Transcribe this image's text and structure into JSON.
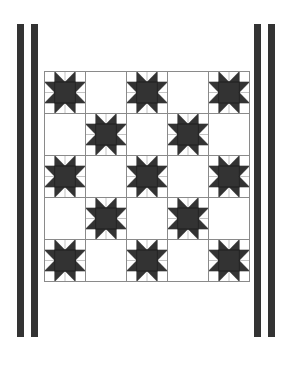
{
  "design": {
    "type": "quilt-pattern",
    "block_name": "sawtooth-star",
    "grid": {
      "rows": 5,
      "cols": 5
    },
    "star_cells": [
      [
        0,
        0
      ],
      [
        0,
        2
      ],
      [
        0,
        4
      ],
      [
        1,
        1
      ],
      [
        1,
        3
      ],
      [
        2,
        0
      ],
      [
        2,
        2
      ],
      [
        2,
        4
      ],
      [
        3,
        1
      ],
      [
        3,
        3
      ],
      [
        4,
        0
      ],
      [
        4,
        2
      ],
      [
        4,
        4
      ]
    ],
    "colors": {
      "dark": "#333333",
      "light": "#ffffff",
      "grid_line": "#8a8a8a",
      "sub_line": "#9a9a9a"
    },
    "borders": {
      "left_stripes": [
        {
          "x": 17,
          "w": 7
        },
        {
          "x": 31,
          "w": 7
        }
      ],
      "right_stripes": [
        {
          "x": 254,
          "w": 7
        },
        {
          "x": 268,
          "w": 7
        }
      ],
      "top": 24,
      "bottom": 337
    }
  }
}
